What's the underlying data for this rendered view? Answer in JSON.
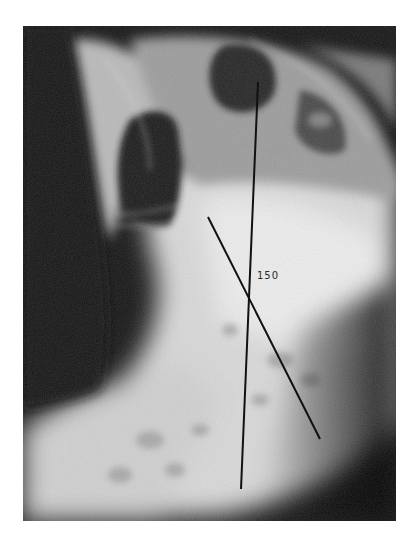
{
  "image": {
    "description": "Lateral spine radiograph with two drawn reference lines measuring an angle",
    "background": "#ffffff",
    "film_bounds": {
      "x": 23,
      "y": 26,
      "width": 373,
      "height": 495
    }
  },
  "annotations": {
    "angle_label": "150",
    "vertical_line": {
      "x1": 258,
      "y1": 82,
      "x2": 241,
      "y2": 489,
      "color": "#111111"
    },
    "diagonal_line": {
      "x1": 208,
      "y1": 217,
      "x2": 320,
      "y2": 439,
      "color": "#111111"
    }
  },
  "id_plate": {
    "line1": "S CHILDREN'S HOSPITAL",
    "line2": "— —"
  }
}
